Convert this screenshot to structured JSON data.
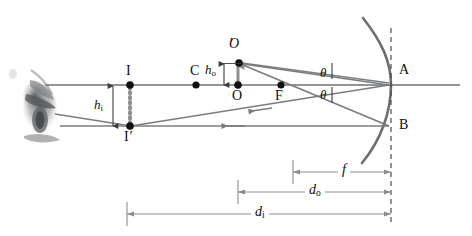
{
  "figure": {
    "type": "ray-diagram",
    "colors": {
      "axis": "#6f7072",
      "ray": "#7a7c7e",
      "mirror": "#6d6e70",
      "dimension": "#8a8c8e",
      "label": "#0d0d0d",
      "point": "#111111",
      "dotted_object": "#8d8f91",
      "background": "#ffffff"
    }
  },
  "labels": {
    "object_top": "O",
    "object_top_prime": "′",
    "object_base": "O",
    "image_top": "I",
    "image_base": "I",
    "image_base_prime": "′",
    "center_of_curvature": "C",
    "focal_point": "F",
    "mirror_vertex": "A",
    "mirror_lower": "B",
    "object_height": "h",
    "object_height_sub": "o",
    "image_height": "h",
    "image_height_sub": "i",
    "angle_incident": "θ",
    "angle_reflected": "θ",
    "focal_length": "f",
    "object_distance": "d",
    "object_distance_sub": "o",
    "image_distance": "d",
    "image_distance_sub": "i"
  },
  "geometry": {
    "axis_y": 85,
    "axis_x_start": 45,
    "axis_x_end": 460,
    "mirror_vertex_x": 391,
    "mirror_b_y": 127,
    "point_C_x": 196,
    "point_F_x": 281,
    "point_O_x": 238,
    "point_O_prime_y": 63,
    "point_I_x": 130,
    "point_I_prime_y": 126,
    "dim_f_x1": 293,
    "dim_do_x1": 238,
    "dim_di_x1": 127,
    "dim_x2": 391,
    "dim_f_y": 172,
    "dim_do_y": 192,
    "dim_di_y": 214
  },
  "annotations": {
    "observer": "eye"
  }
}
